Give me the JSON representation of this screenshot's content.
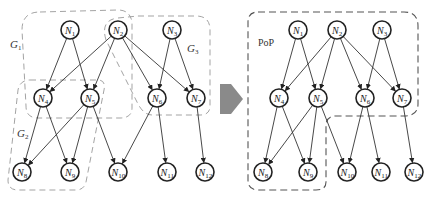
{
  "diagram": {
    "left": {
      "nodes": [
        {
          "id": "N1",
          "label": "N",
          "sub": "1",
          "x": 70,
          "y": 30
        },
        {
          "id": "N2",
          "label": "N",
          "sub": "2",
          "x": 118,
          "y": 30
        },
        {
          "id": "N3",
          "label": "N",
          "sub": "3",
          "x": 172,
          "y": 30
        },
        {
          "id": "N4",
          "label": "N",
          "sub": "4",
          "x": 43,
          "y": 98
        },
        {
          "id": "N5",
          "label": "N",
          "sub": "5",
          "x": 90,
          "y": 98
        },
        {
          "id": "N6",
          "label": "N",
          "sub": "6",
          "x": 157,
          "y": 98
        },
        {
          "id": "N7",
          "label": "N",
          "sub": "7",
          "x": 196,
          "y": 98
        },
        {
          "id": "N8",
          "label": "N",
          "sub": "8",
          "x": 22,
          "y": 172
        },
        {
          "id": "N9",
          "label": "N",
          "sub": "9",
          "x": 70,
          "y": 172
        },
        {
          "id": "N10",
          "label": "N",
          "sub": "10",
          "x": 118,
          "y": 172
        },
        {
          "id": "N11",
          "label": "N",
          "sub": "11",
          "x": 167,
          "y": 172
        },
        {
          "id": "N12",
          "label": "N",
          "sub": "12",
          "x": 205,
          "y": 172
        }
      ],
      "groups": [
        {
          "id": "G1",
          "label": "G",
          "sub": "1",
          "x": 10,
          "y": 48
        },
        {
          "id": "G2",
          "label": "G",
          "sub": "2",
          "x": 17,
          "y": 137
        },
        {
          "id": "G3",
          "label": "G",
          "sub": "3",
          "x": 187,
          "y": 52
        }
      ]
    },
    "right": {
      "nodes": [
        {
          "id": "N1",
          "label": "N",
          "sub": "1",
          "x": 298,
          "y": 30
        },
        {
          "id": "N2",
          "label": "N",
          "sub": "2",
          "x": 337,
          "y": 30
        },
        {
          "id": "N3",
          "label": "N",
          "sub": "3",
          "x": 382,
          "y": 30
        },
        {
          "id": "N4",
          "label": "N",
          "sub": "4",
          "x": 279,
          "y": 98
        },
        {
          "id": "N5",
          "label": "N",
          "sub": "5",
          "x": 318,
          "y": 98
        },
        {
          "id": "N6",
          "label": "N",
          "sub": "6",
          "x": 365,
          "y": 98
        },
        {
          "id": "N7",
          "label": "N",
          "sub": "7",
          "x": 402,
          "y": 98
        },
        {
          "id": "N8",
          "label": "N",
          "sub": "8",
          "x": 263,
          "y": 172
        },
        {
          "id": "N9",
          "label": "N",
          "sub": "9",
          "x": 308,
          "y": 172
        },
        {
          "id": "N10",
          "label": "N",
          "sub": "10",
          "x": 347,
          "y": 172
        },
        {
          "id": "N11",
          "label": "N",
          "sub": "11",
          "x": 381,
          "y": 172
        },
        {
          "id": "N12",
          "label": "N",
          "sub": "12",
          "x": 414,
          "y": 172
        }
      ],
      "region_label": "PoP"
    },
    "edges": [
      [
        "N1",
        "N4"
      ],
      [
        "N1",
        "N5"
      ],
      [
        "N2",
        "N4"
      ],
      [
        "N2",
        "N5"
      ],
      [
        "N2",
        "N6"
      ],
      [
        "N2",
        "N7"
      ],
      [
        "N3",
        "N6"
      ],
      [
        "N3",
        "N7"
      ],
      [
        "N4",
        "N8"
      ],
      [
        "N4",
        "N9"
      ],
      [
        "N5",
        "N8"
      ],
      [
        "N5",
        "N9"
      ],
      [
        "N5",
        "N10"
      ],
      [
        "N6",
        "N10"
      ],
      [
        "N6",
        "N11"
      ],
      [
        "N7",
        "N12"
      ]
    ],
    "arrow_color": "#8a8a8a"
  }
}
